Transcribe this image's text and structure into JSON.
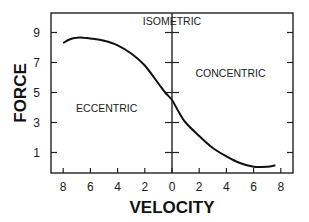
{
  "chart_data": {
    "type": "line",
    "title": "",
    "xlabel": "VELOCITY",
    "ylabel": "FORCE",
    "x_tick_labels": [
      "8",
      "6",
      "4",
      "2",
      "0",
      "2",
      "4",
      "6",
      "8"
    ],
    "x_tick_values": [
      -8,
      -6,
      -4,
      -2,
      0,
      2,
      4,
      6,
      8
    ],
    "y_tick_labels": [
      "9",
      "7",
      "5",
      "3",
      "1"
    ],
    "y_tick_values": [
      9,
      7,
      5,
      3,
      1
    ],
    "xlim": [
      -8.4,
      8.8
    ],
    "ylim": [
      -0.4,
      10.3
    ],
    "grid": false,
    "legend": null,
    "annotations": [
      {
        "text": "ISOMETRIC",
        "x": 0,
        "y": 9.8
      },
      {
        "text": "CONCENTRIC",
        "x": 4.3,
        "y": 6.3
      },
      {
        "text": "ECCENTRIC",
        "x": -4.8,
        "y": 4.0
      }
    ],
    "series": [
      {
        "name": "force-velocity curve",
        "x": [
          -8.0,
          -7.5,
          -7.0,
          -6.5,
          -6.0,
          -5.0,
          -4.0,
          -3.0,
          -2.0,
          -1.0,
          -0.5,
          0.0,
          0.5,
          1.0,
          2.0,
          3.0,
          4.0,
          5.0,
          6.0,
          7.0,
          7.6
        ],
        "y": [
          8.3,
          8.55,
          8.65,
          8.65,
          8.6,
          8.45,
          8.15,
          7.6,
          6.8,
          5.6,
          5.0,
          4.5,
          3.7,
          3.0,
          2.1,
          1.3,
          0.75,
          0.3,
          0.05,
          0.05,
          0.15
        ]
      }
    ],
    "vertical_reference_line": {
      "x": 0,
      "label": "ISOMETRIC"
    }
  }
}
